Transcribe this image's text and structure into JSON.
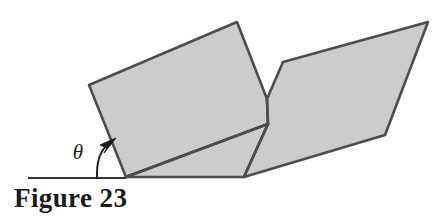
{
  "figure": {
    "caption": "Figure 23",
    "angle_label": "θ",
    "angle_label_name": "theta",
    "colors": {
      "fill": "#cccccc",
      "stroke": "#4d4d4d",
      "ground_line": "#333333",
      "text": "#1b1b1b",
      "background": "#ffffff"
    },
    "stroke_width": 2.6,
    "ground_line": {
      "x1": 28,
      "y1": 178,
      "x2": 126,
      "y2": 178
    },
    "angle_arc": {
      "path": "M 97 178 Q 96 152 110 143",
      "arrow_tip_x": 114,
      "arrow_tip_y": 140,
      "arrow_points": "114,140 101,146 107,149 105,152"
    },
    "label_positions": {
      "theta_x": 78,
      "theta_y": 158
    },
    "shapes": [
      {
        "name": "left-plane-upper",
        "points": "89,85 237,22 267,99 268,124 126,177"
      },
      {
        "name": "left-plane-lower",
        "points": "126,177 268,124 244,177"
      },
      {
        "name": "right-plane",
        "points": "283,62 428,22 385,135 244,177 268,124 267,99"
      }
    ],
    "fold_lines": [
      {
        "name": "left-plane-fold",
        "x1": 126,
        "y1": 177,
        "x2": 268,
        "y2": 124
      },
      {
        "name": "valley-crease",
        "x1": 267,
        "y1": 99,
        "x2": 268,
        "y2": 124
      },
      {
        "name": "right-plane-lower-crease",
        "x1": 268,
        "y1": 124,
        "x2": 244,
        "y2": 177
      }
    ]
  }
}
